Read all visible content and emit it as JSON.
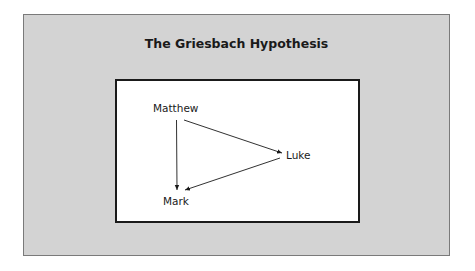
{
  "diagram": {
    "title": "The Griesbach Hypothesis",
    "nodes": [
      {
        "id": "matthew",
        "label": "Matthew"
      },
      {
        "id": "luke",
        "label": "Luke"
      },
      {
        "id": "mark",
        "label": "Mark"
      }
    ],
    "edges": [
      {
        "from": "matthew",
        "to": "mark"
      },
      {
        "from": "matthew",
        "to": "luke"
      },
      {
        "from": "luke",
        "to": "mark"
      }
    ]
  },
  "colors": {
    "panel_background": "#d3d3d3",
    "box_background": "#ffffff",
    "ink": "#1a1a1a"
  }
}
